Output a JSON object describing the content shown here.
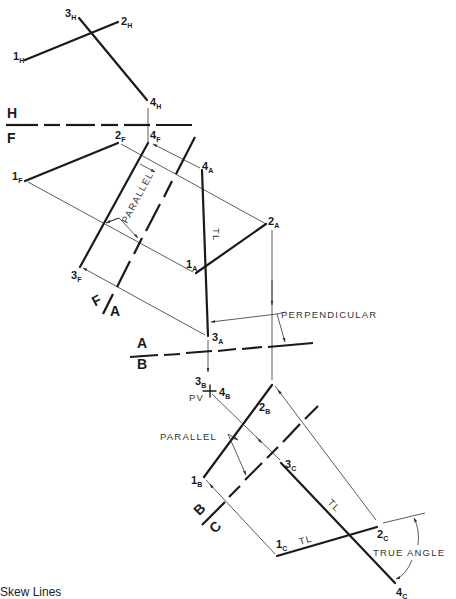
{
  "figure": {
    "caption": "Skew Lines",
    "colors": {
      "ink": "#1a1a1a",
      "background": "#ffffff"
    }
  },
  "views": {
    "H": {
      "points": [
        {
          "id": "1H",
          "num": "1",
          "sub": "H"
        },
        {
          "id": "2H",
          "num": "2",
          "sub": "H"
        },
        {
          "id": "3H",
          "num": "3",
          "sub": "H"
        },
        {
          "id": "4H",
          "num": "4",
          "sub": "H"
        }
      ]
    },
    "F": {
      "points": [
        {
          "id": "1F",
          "num": "1",
          "sub": "F"
        },
        {
          "id": "2F",
          "num": "2",
          "sub": "F"
        },
        {
          "id": "3F",
          "num": "3",
          "sub": "F"
        },
        {
          "id": "4F",
          "num": "4",
          "sub": "F"
        }
      ]
    },
    "A": {
      "points": [
        {
          "id": "1A",
          "num": "1",
          "sub": "A"
        },
        {
          "id": "2A",
          "num": "2",
          "sub": "A"
        },
        {
          "id": "3A",
          "num": "3",
          "sub": "A"
        },
        {
          "id": "4A",
          "num": "4",
          "sub": "A"
        }
      ]
    },
    "B": {
      "points": [
        {
          "id": "1B",
          "num": "1",
          "sub": "B"
        },
        {
          "id": "2B",
          "num": "2",
          "sub": "B"
        },
        {
          "id": "3B",
          "num": "3",
          "sub": "B"
        },
        {
          "id": "4B",
          "num": "4",
          "sub": "B"
        }
      ]
    },
    "C": {
      "points": [
        {
          "id": "1C",
          "num": "1",
          "sub": "C"
        },
        {
          "id": "2C",
          "num": "2",
          "sub": "C"
        },
        {
          "id": "3C",
          "num": "3",
          "sub": "C"
        },
        {
          "id": "4C",
          "num": "4",
          "sub": "C"
        }
      ]
    }
  },
  "fold_lines": {
    "HF": {
      "top": "H",
      "bottom": "F"
    },
    "FA": {
      "left": "F",
      "right": "A"
    },
    "AB": {
      "top": "A",
      "bottom": "B"
    },
    "BC": {
      "left": "B",
      "right": "C"
    }
  },
  "annotations": {
    "parallel_1": "PARALLEL",
    "tl_A": "TL",
    "perpendicular": "PERPENDICULAR",
    "pv": "PV",
    "parallel_2": "PARALLEL",
    "tl_C_34": "TL",
    "tl_C_12": "TL",
    "true_angle": "TRUE ANGLE"
  }
}
